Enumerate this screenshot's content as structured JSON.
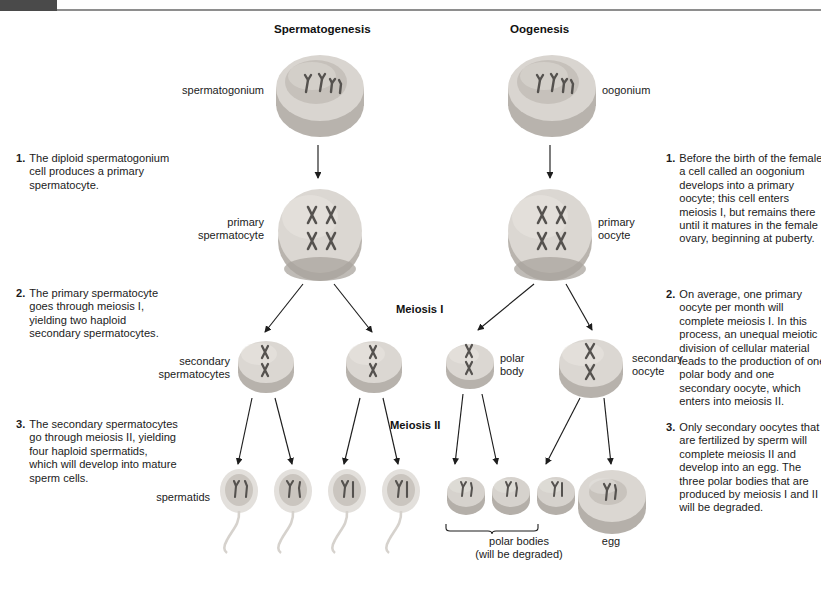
{
  "figure": {
    "type": "biology-diagram"
  },
  "headings": {
    "spermatogenesis": "Spermatogenesis",
    "oogenesis": "Oogenesis"
  },
  "phases": {
    "meiosis_1": "Meiosis I",
    "meiosis_2": "Meiosis II"
  },
  "cell_labels": {
    "spermatogonium": "spermatogonium",
    "primary_spermatocyte": "primary\nspermatocyte",
    "primary_spermatocyte_l1": "primary",
    "primary_spermatocyte_l2": "spermatocyte",
    "secondary_spermatocytes_l1": "secondary",
    "secondary_spermatocytes_l2": "spermatocytes",
    "spermatids": "spermatids",
    "oogonium": "oogonium",
    "primary_oocyte_l1": "primary",
    "primary_oocyte_l2": "oocyte",
    "polar_body_l1": "polar",
    "polar_body_l2": "body",
    "secondary_oocyte_l1": "secondary",
    "secondary_oocyte_l2": "oocyte",
    "polar_bodies_l1": "polar bodies",
    "polar_bodies_l2": "(will be degraded)",
    "egg": "egg"
  },
  "left_steps": [
    {
      "num": "1.",
      "text": "The diploid spermatogonium cell produces a primary spermatocyte."
    },
    {
      "num": "2.",
      "text": "The primary spermatocyte goes through meiosis I, yielding two haploid secondary spermatocytes."
    },
    {
      "num": "3.",
      "text": "The secondary spermatocytes go through meiosis II, yielding four haploid spermatids, which will develop into mature sperm cells."
    }
  ],
  "right_steps": [
    {
      "num": "1.",
      "text": "Before the birth of the female, a cell called an oogonium develops into a primary oocyte; this cell enters meiosis I, but remains there until it matures in the female ovary, beginning at puberty."
    },
    {
      "num": "2.",
      "text": "On average, one primary oocyte per month will complete meiosis I. In this process, an unequal meiotic division of cellular material leads to the production of one polar body and one secondary oocyte, which enters into meiosis II."
    },
    {
      "num": "3.",
      "text": "Only secondary oocytes that are fertilized by sperm will complete meiosis II and develop into an egg. The three polar bodies that are produced by meiosis I and II will be degraded."
    }
  ],
  "colors": {
    "cell_body": "#cfcbc6",
    "cell_body_light": "#e6e3df",
    "cell_body_dark": "#a7a29c",
    "nucleus": "#c2bdb7",
    "chromosome": "#55524f",
    "text": "#1b1b1b",
    "topbar": "#4a4a4a",
    "rule": "#8e8e8e",
    "connector": "#1d1d1d"
  },
  "cells": [
    {
      "name": "spermatogonium",
      "chromosomes": 4,
      "form": "single-strand",
      "size": "large",
      "shape": "disc"
    },
    {
      "name": "primary-spermatocyte",
      "chromosomes": 4,
      "form": "duplicated",
      "size": "large",
      "shape": "round"
    },
    {
      "name": "secondary-spermatocyte-left",
      "chromosomes": 2,
      "form": "duplicated",
      "size": "medium",
      "shape": "disc"
    },
    {
      "name": "secondary-spermatocyte-right",
      "chromosomes": 2,
      "form": "duplicated",
      "size": "medium",
      "shape": "disc"
    },
    {
      "name": "spermatid-1",
      "chromosomes": 2,
      "form": "single-strand",
      "size": "small",
      "shape": "sperm"
    },
    {
      "name": "spermatid-2",
      "chromosomes": 2,
      "form": "single-strand",
      "size": "small",
      "shape": "sperm"
    },
    {
      "name": "spermatid-3",
      "chromosomes": 2,
      "form": "single-strand",
      "size": "small",
      "shape": "sperm"
    },
    {
      "name": "spermatid-4",
      "chromosomes": 2,
      "form": "single-strand",
      "size": "small",
      "shape": "sperm"
    },
    {
      "name": "oogonium",
      "chromosomes": 4,
      "form": "single-strand",
      "size": "large",
      "shape": "disc"
    },
    {
      "name": "primary-oocyte",
      "chromosomes": 4,
      "form": "duplicated",
      "size": "large",
      "shape": "round"
    },
    {
      "name": "polar-body-first",
      "chromosomes": 2,
      "form": "duplicated",
      "size": "small",
      "shape": "disc"
    },
    {
      "name": "secondary-oocyte",
      "chromosomes": 2,
      "form": "duplicated",
      "size": "medium",
      "shape": "disc"
    },
    {
      "name": "polar-body-a",
      "chromosomes": 2,
      "form": "single-strand",
      "size": "tiny",
      "shape": "disc"
    },
    {
      "name": "polar-body-b",
      "chromosomes": 2,
      "form": "single-strand",
      "size": "tiny",
      "shape": "disc"
    },
    {
      "name": "polar-body-c",
      "chromosomes": 2,
      "form": "single-strand",
      "size": "tiny",
      "shape": "disc"
    },
    {
      "name": "egg",
      "chromosomes": 2,
      "form": "single-strand",
      "size": "large",
      "shape": "disc"
    }
  ]
}
